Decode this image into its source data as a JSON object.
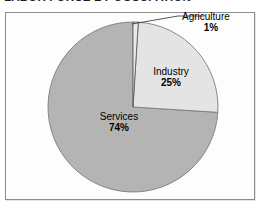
{
  "chart_title": "LABOR FORCE BY OCCUPATION",
  "frame": {
    "border_color": "#8c8c8c",
    "background_color": "#fdfdfd"
  },
  "labels": {
    "agriculture": {
      "name": "Agriculture",
      "pct": "1%"
    },
    "industry": {
      "name": "Industry",
      "pct": "25%"
    },
    "services": {
      "name": "Services",
      "pct": "74%"
    }
  },
  "chart_data": {
    "type": "pie",
    "title": "LABOR FORCE BY OCCUPATION",
    "xlabel": "",
    "ylabel": "",
    "unit": "percent",
    "start_angle_deg": 0,
    "direction": "clockwise",
    "legend": "none",
    "grid": false,
    "labels_inside": true,
    "categories": [
      "Agriculture",
      "Industry",
      "Services"
    ],
    "values": [
      1,
      25,
      74
    ],
    "value_labels": [
      "1%",
      "25%",
      "74%"
    ],
    "colors": [
      "#e9e9e9",
      "#e4e4e4",
      "#b4b4b4"
    ],
    "slices": [
      {
        "label": "Agriculture",
        "value": 1,
        "display": "1%",
        "color": "#e9e9e9",
        "leader_line": true
      },
      {
        "label": "Industry",
        "value": 25,
        "display": "25%",
        "color": "#e4e4e4",
        "leader_line": false
      },
      {
        "label": "Services",
        "value": 74,
        "display": "74%",
        "color": "#b4b4b4",
        "leader_line": false
      }
    ]
  }
}
